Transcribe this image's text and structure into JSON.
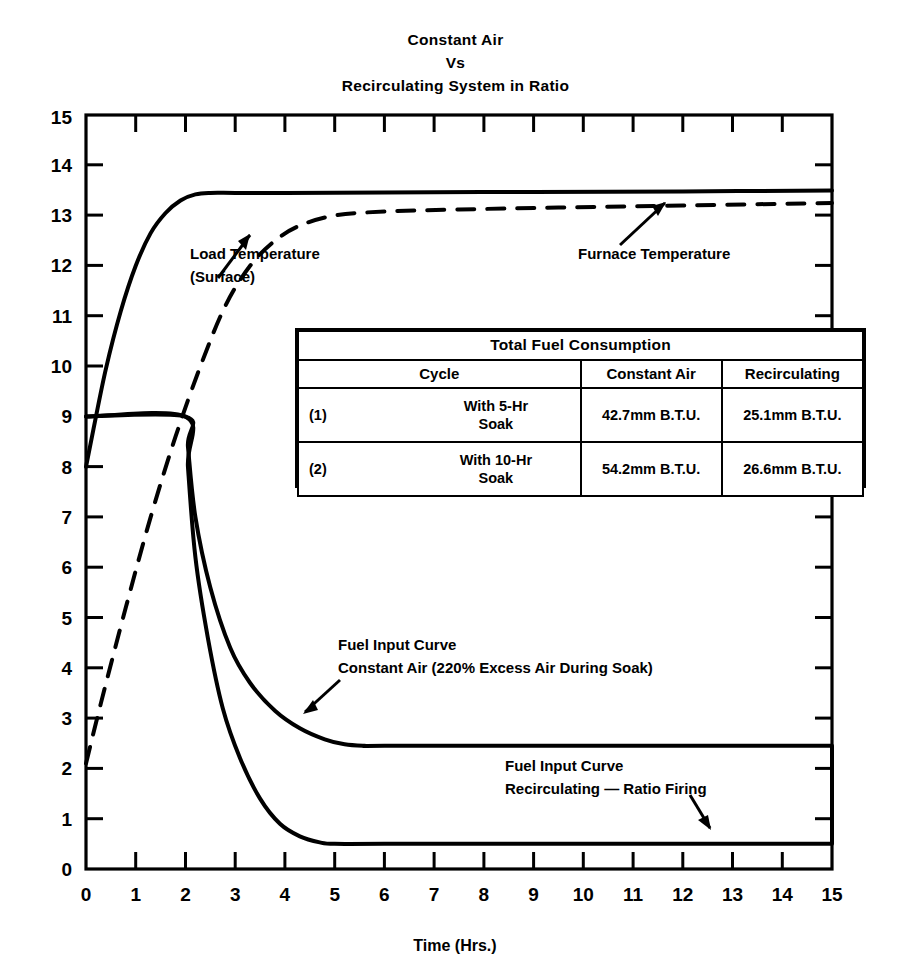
{
  "chart_data": {
    "type": "line",
    "title": "Constant Air Vs Recirculating System in Ratio",
    "title_lines": [
      "Constant Air",
      "Vs",
      "Recirculating System in Ratio"
    ],
    "xlabel": "Time (Hrs.)",
    "ylabel": "",
    "xlim": [
      0,
      15
    ],
    "ylim": [
      0,
      15
    ],
    "xticks": [
      "0",
      "1",
      "2",
      "3",
      "4",
      "5",
      "6",
      "7",
      "8",
      "9",
      "10",
      "11",
      "12",
      "13",
      "14",
      "15"
    ],
    "yticks": [
      "0",
      "1",
      "2",
      "3",
      "4",
      "5",
      "6",
      "7",
      "8",
      "9",
      "10",
      "11",
      "12",
      "13",
      "14",
      "15"
    ],
    "grid": false,
    "legend_position": "none",
    "series": [
      {
        "name": "Furnace Temperature",
        "style": "solid",
        "x": [
          0,
          0.15,
          0.4,
          0.7,
          1.0,
          1.3,
          1.6,
          1.9,
          2.2,
          2.5,
          3.0,
          4.0,
          6.0,
          9.0,
          12.0,
          15.0
        ],
        "y": [
          8.0,
          8.75,
          9.95,
          11.1,
          12.0,
          12.65,
          13.05,
          13.3,
          13.42,
          13.45,
          13.45,
          13.45,
          13.46,
          13.47,
          13.48,
          13.5
        ]
      },
      {
        "name": "Load Temperature (Surface)",
        "style": "dashed",
        "x": [
          0,
          0.3,
          0.8,
          1.3,
          1.8,
          2.3,
          2.8,
          3.3,
          3.8,
          4.3,
          5.0,
          6.0,
          7.5,
          9.5,
          12.0,
          15.0
        ],
        "y": [
          2.1,
          3.3,
          5.2,
          7.0,
          8.6,
          10.0,
          11.2,
          12.0,
          12.5,
          12.8,
          13.0,
          13.08,
          13.12,
          13.16,
          13.2,
          13.25
        ]
      },
      {
        "name": "Fuel Input Curve Constant Air (220% Excess Air During Soak)",
        "style": "solid",
        "x": [
          0,
          2.0,
          2.05,
          2.2,
          2.5,
          2.9,
          3.3,
          3.8,
          4.3,
          4.8,
          5.2,
          5.6,
          6.0,
          10.0,
          15.0
        ],
        "y": [
          9.0,
          9.0,
          8.4,
          7.0,
          5.6,
          4.4,
          3.7,
          3.15,
          2.8,
          2.58,
          2.48,
          2.45,
          2.45,
          2.45,
          2.45
        ]
      },
      {
        "name": "Fuel Input Curve Recirculating — Ratio Firing",
        "style": "solid",
        "x": [
          0,
          2.0,
          2.05,
          2.2,
          2.45,
          2.75,
          3.1,
          3.5,
          3.9,
          4.3,
          4.7,
          5.0,
          6.0,
          10.0,
          15.0
        ],
        "y": [
          9.0,
          9.0,
          8.0,
          6.2,
          4.6,
          3.2,
          2.2,
          1.4,
          0.9,
          0.65,
          0.53,
          0.5,
          0.5,
          0.5,
          0.5
        ]
      }
    ],
    "annotations": [
      {
        "name": "load-temperature",
        "lines": [
          "Load Temperature",
          "(Surface)"
        ],
        "target": {
          "x": 3.25,
          "y": 13.08
        }
      },
      {
        "name": "furnace-temperature",
        "lines": [
          "Furnace Temperature"
        ],
        "target": {
          "x": 11.6,
          "y": 13.47
        }
      },
      {
        "name": "fuel-input-constant-air",
        "lines": [
          "Fuel Input Curve",
          "Constant Air (220% Excess Air During Soak)"
        ],
        "target": {
          "x": 3.45,
          "y": 3.55
        }
      },
      {
        "name": "fuel-input-recirculating",
        "lines": [
          "Fuel Input Curve",
          "Recirculating — Ratio Firing"
        ],
        "target": {
          "x": 12.45,
          "y": 0.55
        }
      }
    ]
  },
  "table": {
    "title": "Total Fuel Consumption",
    "columns": [
      "Cycle",
      "Constant Air",
      "Recirculating"
    ],
    "rows": [
      {
        "index": "(1)",
        "cycle_line1": "With 5-Hr",
        "cycle_line2": "Soak",
        "constant_air": "42.7mm B.T.U.",
        "recirculating": "25.1mm B.T.U."
      },
      {
        "index": "(2)",
        "cycle_line1": "With 10-Hr",
        "cycle_line2": "Soak",
        "constant_air": "54.2mm B.T.U.",
        "recirculating": "26.6mm B.T.U."
      }
    ]
  },
  "colors": {
    "ink": "#000000",
    "background": "#ffffff"
  }
}
